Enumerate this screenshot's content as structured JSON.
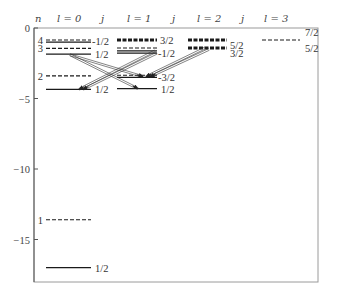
{
  "header": {
    "n": "n",
    "l0": "l = 0",
    "j0": "j",
    "l1": "l = 1",
    "j1": "j",
    "l2": "l = 2",
    "j2": "j",
    "l3": "l = 3"
  },
  "axis": {
    "ticks": [
      {
        "value": 0,
        "label": "0"
      },
      {
        "value": -5,
        "label": "−5"
      },
      {
        "value": -10,
        "label": "−10"
      },
      {
        "value": -15,
        "label": "−15"
      }
    ],
    "ylim": [
      -18.1,
      0.1
    ]
  },
  "colors": {
    "level": "#1a1a1a",
    "frame": "#9a9a9a",
    "axis": "#555555",
    "transition": "#333333",
    "text": "#333333"
  },
  "chart_data": {
    "type": "energy-level-diagram",
    "title": "",
    "ylabel": "Energy",
    "columns": [
      {
        "l": 0,
        "x1": 46,
        "x2": 91
      },
      {
        "l": 1,
        "x1": 117,
        "x2": 157
      },
      {
        "l": 2,
        "x1": 188,
        "x2": 227
      },
      {
        "l": 3,
        "x1": 262,
        "x2": 300
      }
    ],
    "hydrogen_levels_dashed": [
      {
        "n": 1,
        "E": -13.6
      },
      {
        "n": 2,
        "E": -3.4
      },
      {
        "n": 3,
        "E": -1.51
      },
      {
        "n": 4,
        "E": -0.85
      }
    ],
    "levels": [
      {
        "l": 0,
        "style": "dashed",
        "E": -0.85,
        "n_label": "4"
      },
      {
        "l": 0,
        "style": "solid",
        "E": -1.0,
        "j": "-1/2",
        "label_dy": -1
      },
      {
        "l": 0,
        "style": "dashed",
        "E": -1.45,
        "n_label": "3"
      },
      {
        "l": 0,
        "style": "solid",
        "E": -1.85,
        "j": "1/2",
        "label_dx": 4
      },
      {
        "l": 0,
        "style": "dashed",
        "E": -3.4,
        "n_label": "2"
      },
      {
        "l": 0,
        "style": "solid",
        "E": -4.35,
        "j": "1/2",
        "label_dx": 4
      },
      {
        "l": 0,
        "style": "dashed",
        "E": -13.6,
        "n_label": "1"
      },
      {
        "l": 0,
        "style": "solid",
        "E": -17.0,
        "j": "1/2",
        "label_dx": 4
      },
      {
        "l": 1,
        "style": "thickdashed",
        "E": -0.85,
        "j": "3/2",
        "label_dx": 3
      },
      {
        "l": 1,
        "style": "dashed",
        "E": -1.42
      },
      {
        "l": 1,
        "style": "solid",
        "E": -1.62
      },
      {
        "l": 1,
        "style": "solid",
        "E": -1.78,
        "j": "-1/2"
      },
      {
        "l": 1,
        "style": "dashed",
        "E": -3.35
      },
      {
        "l": 1,
        "style": "solid",
        "E": -3.5,
        "j": "-3/2"
      },
      {
        "l": 1,
        "style": "solid",
        "E": -4.3,
        "j": "1/2",
        "label_dx": 4
      },
      {
        "l": 2,
        "style": "thickdashed",
        "E": -0.85,
        "j": "5/2",
        "label_dx": 3,
        "label_dy": 5
      },
      {
        "l": 2,
        "style": "thickdashed",
        "E": -1.42,
        "j": "3/2",
        "label_dx": 3,
        "label_dy": 5
      },
      {
        "l": 3,
        "style": "dashed",
        "E": -0.85
      }
    ],
    "extra_labels": [
      {
        "text": "7/2",
        "x": 305,
        "y": 36
      },
      {
        "text": "5/2",
        "x": 305,
        "y": 52
      }
    ],
    "transitions": [
      {
        "from": {
          "x": 70,
          "E": -1.9
        },
        "to": {
          "x": 143,
          "E": -3.45
        }
      },
      {
        "from": {
          "x": 70,
          "E": -1.9
        },
        "to": {
          "x": 138,
          "E": -4.3
        }
      },
      {
        "from": {
          "x": 155,
          "E": -1.62
        },
        "to": {
          "x": 79,
          "E": -4.35
        }
      },
      {
        "from": {
          "x": 157,
          "E": -1.78
        },
        "to": {
          "x": 83,
          "E": -4.35
        }
      },
      {
        "from": {
          "x": 205,
          "E": -1.42
        },
        "to": {
          "x": 146,
          "E": -3.45
        }
      },
      {
        "from": {
          "x": 209,
          "E": -1.52
        },
        "to": {
          "x": 150,
          "E": -3.45
        }
      }
    ]
  }
}
